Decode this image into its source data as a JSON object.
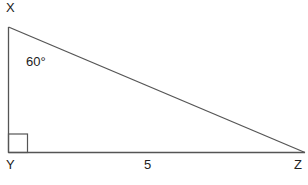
{
  "diagram": {
    "type": "right-triangle",
    "vertices": {
      "X": {
        "label": "X"
      },
      "Y": {
        "label": "Y"
      },
      "Z": {
        "label": "Z"
      }
    },
    "angle_label": "60°",
    "side_label": "5",
    "right_angle_at": "Y",
    "line_color": "#555555"
  }
}
